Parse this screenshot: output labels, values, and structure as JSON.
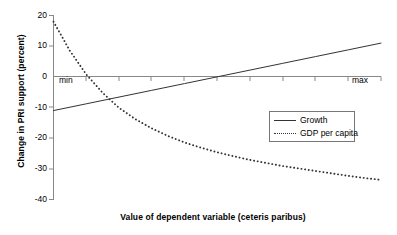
{
  "chart_data": {
    "type": "line",
    "title": "",
    "xlabel": "Value of dependent variable (ceteris paribus)",
    "ylabel": "Change in PRI support (percent)",
    "ylim": [
      -40,
      20
    ],
    "yticks": [
      20,
      10,
      0,
      -10,
      -20,
      -30,
      -40
    ],
    "ytick_labels": [
      "20",
      "10",
      "0",
      "-10",
      "-20",
      "-30",
      "-40"
    ],
    "xlim": [
      0,
      1
    ],
    "xtick_labels": [
      "min",
      "max"
    ],
    "x_axis_line_at": 0,
    "grid": false,
    "legend_position": "center-right",
    "series": [
      {
        "name": "Growth",
        "style": "solid",
        "color": "#333333",
        "x": [
          0.0,
          0.1,
          0.2,
          0.3,
          0.4,
          0.5,
          0.6,
          0.7,
          0.8,
          0.9,
          1.0
        ],
        "values": [
          -11.0,
          -8.8,
          -6.6,
          -4.4,
          -2.2,
          0.0,
          2.2,
          4.4,
          6.6,
          8.8,
          11.0
        ]
      },
      {
        "name": "GDP per capita",
        "style": "dotted",
        "color": "#333333",
        "x": [
          0.0,
          0.05,
          0.1,
          0.15,
          0.2,
          0.25,
          0.3,
          0.35,
          0.4,
          0.45,
          0.5,
          0.55,
          0.6,
          0.65,
          0.7,
          0.75,
          0.8,
          0.85,
          0.9,
          0.95,
          1.0
        ],
        "values": [
          18.0,
          8.5,
          0.8,
          -5.2,
          -10.1,
          -13.8,
          -16.8,
          -19.3,
          -21.4,
          -23.1,
          -24.6,
          -25.9,
          -27.1,
          -28.1,
          -29.1,
          -29.9,
          -30.7,
          -31.5,
          -32.3,
          -33.0,
          -33.6
        ]
      }
    ]
  },
  "legend": {
    "entries": [
      {
        "label": "Growth",
        "style": "solid"
      },
      {
        "label": "GDP per capita",
        "style": "dotted"
      }
    ]
  },
  "axes": {
    "y_title": "Change in PRI support (percent)",
    "x_title": "Value of dependent variable (ceteris paribus)",
    "y_labels": [
      "20",
      "10",
      "0",
      "-10",
      "-20",
      "-30",
      "-40"
    ],
    "x_min_label": "min",
    "x_max_label": "max"
  },
  "colors": {
    "line": "#333333",
    "axis": "#888888",
    "text": "#000000",
    "background": "#ffffff",
    "legend_border": "#777777"
  }
}
